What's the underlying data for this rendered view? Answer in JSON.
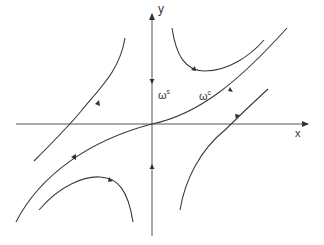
{
  "diagram": {
    "type": "phase-portrait",
    "axes": {
      "x_label": "x",
      "y_label": "y"
    },
    "labels": {
      "stable_manifold": {
        "symbol": "ω",
        "superscript": "s"
      },
      "center_manifold": {
        "symbol": "ω",
        "superscript": "c"
      }
    },
    "colors": {
      "stroke": "#3a3a3a",
      "axis": "#555555",
      "text": "#333333"
    },
    "trajectories": [
      "center-manifold curve through origin",
      "upper-right hyperbola",
      "upper-left branch",
      "lower-left branch",
      "lower-left hyperbola",
      "lower-right branch"
    ]
  }
}
